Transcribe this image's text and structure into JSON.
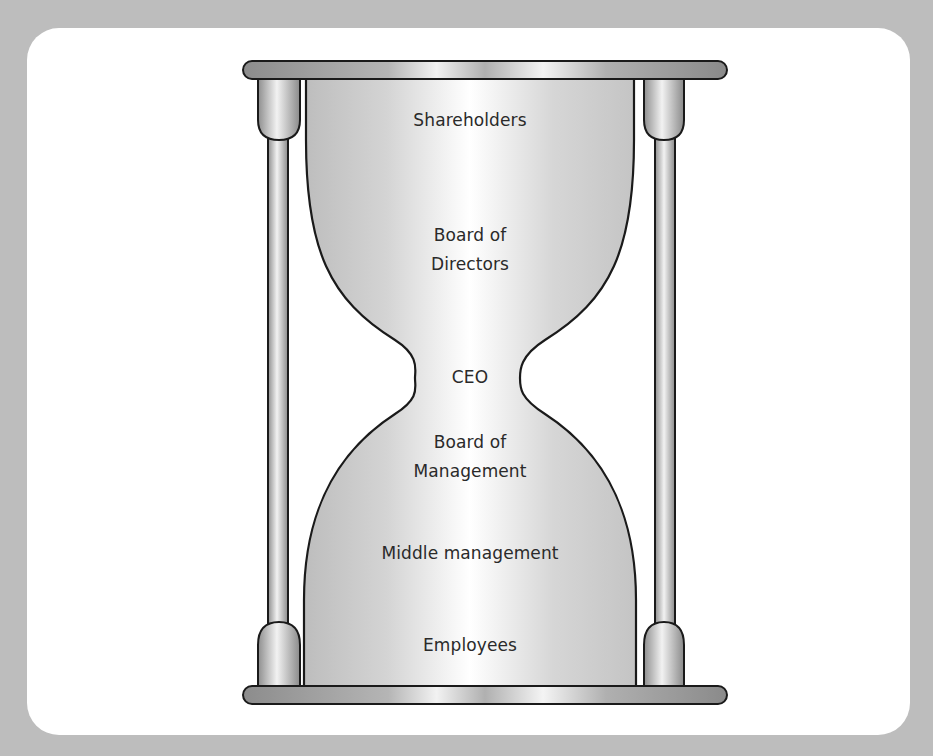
{
  "diagram": {
    "type": "hourglass-hierarchy",
    "colors": {
      "background": "#bdbdbd",
      "panel": "#ffffff",
      "outline": "#1a1a1a",
      "glass_fill": "#d9d9d9",
      "glass_highlight": "#ffffff",
      "frame_fill": "#9a9a9a",
      "text": "#2a2a2a"
    },
    "levels": [
      {
        "id": "shareholders",
        "line1": "Shareholders",
        "line2": ""
      },
      {
        "id": "board-of-directors",
        "line1": "Board of",
        "line2": "Directors"
      },
      {
        "id": "ceo",
        "line1": "CEO",
        "line2": ""
      },
      {
        "id": "board-of-management",
        "line1": "Board of",
        "line2": "Management"
      },
      {
        "id": "middle-management",
        "line1": "Middle management",
        "line2": ""
      },
      {
        "id": "employees",
        "line1": "Employees",
        "line2": ""
      }
    ]
  }
}
